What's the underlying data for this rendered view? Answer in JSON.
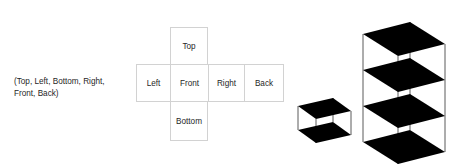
{
  "caption": {
    "text": "(Top, Left, Bottom, Right,\nFront, Back)"
  },
  "net": {
    "cells": [
      {
        "id": "top",
        "label": "Top"
      },
      {
        "id": "left",
        "label": "Left"
      },
      {
        "id": "front",
        "label": "Front"
      },
      {
        "id": "right",
        "label": "Right"
      },
      {
        "id": "back",
        "label": "Back"
      },
      {
        "id": "bottom",
        "label": "Bottom"
      }
    ]
  },
  "figures": {
    "single_cube": {
      "name": "single-cube",
      "plates": 2,
      "stack_count": 1
    },
    "stacked_cubes": {
      "name": "stacked-cubes",
      "plates": 4,
      "stack_count": 3
    }
  },
  "colors": {
    "plate_fill": "#000000",
    "wire_stroke": "#555555",
    "net_border": "#d2d2d2",
    "text": "#1f1f1f",
    "background": "#ffffff"
  }
}
